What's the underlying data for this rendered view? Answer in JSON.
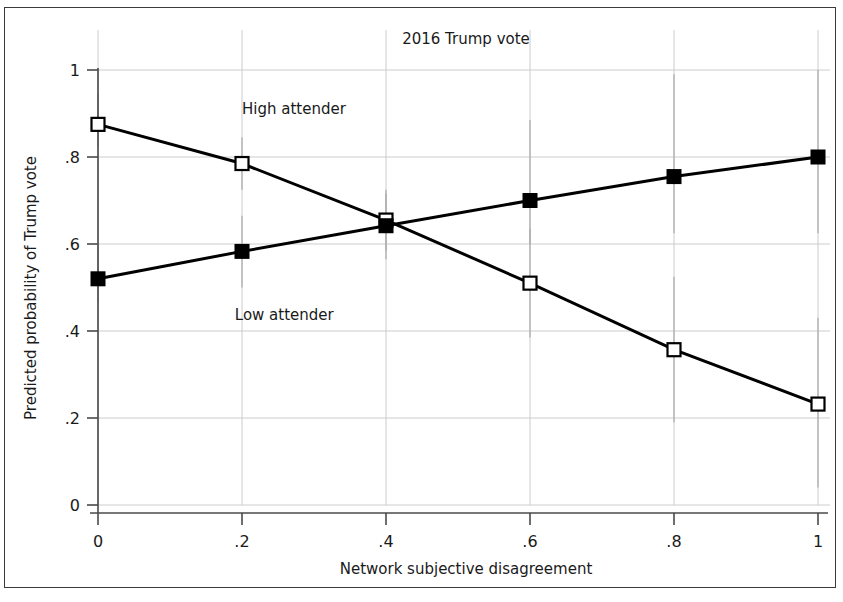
{
  "chart_data": {
    "type": "line",
    "title": "2016 Trump vote",
    "xlabel": "Network subjective disagreement",
    "ylabel": "Predicted probability of Trump vote",
    "x": [
      0,
      0.2,
      0.4,
      0.6,
      0.8,
      1
    ],
    "xticklabels": [
      "0",
      ".2",
      ".4",
      ".6",
      ".8",
      "1"
    ],
    "yticklabels": [
      "0",
      ".2",
      ".4",
      ".6",
      ".8",
      "1"
    ],
    "yticks": [
      0,
      0.2,
      0.4,
      0.6,
      0.8,
      1
    ],
    "xlim": [
      -0.04,
      1.04
    ],
    "ylim": [
      0,
      1.04
    ],
    "grid": "horizontal-and-vertical-light",
    "legend_position": "inline-annotations",
    "series": [
      {
        "name": "High attender",
        "marker": "open-square",
        "values": [
          0.875,
          0.785,
          0.655,
          0.51,
          0.357,
          0.232
        ],
        "errors_low": [
          0.825,
          0.725,
          0.585,
          0.385,
          0.19,
          0.04
        ],
        "errors_high": [
          0.945,
          0.845,
          0.725,
          0.635,
          0.525,
          0.43
        ],
        "label": "High attender",
        "label_x": 0.2,
        "label_y": 0.9
      },
      {
        "name": "Low attender",
        "marker": "filled-square",
        "values": [
          0.52,
          0.583,
          0.642,
          0.7,
          0.755,
          0.8
        ],
        "errors_low": [
          0.465,
          0.5,
          0.565,
          0.6,
          0.625,
          0.625
        ],
        "errors_high": [
          0.595,
          0.665,
          0.715,
          0.885,
          0.99,
          1.0
        ],
        "label": "Low attender",
        "label_x": 0.19,
        "label_y": 0.425
      }
    ],
    "colors": {
      "line": "#000000",
      "marker_fill_open": "#ffffff",
      "marker_fill_closed": "#000000",
      "grid": "#cccccc",
      "axis": "#4a4a4a",
      "error_bar": "#aaaaaa",
      "text": "#1a1a1a",
      "background": "#ffffff",
      "frame": "#3a3a3a"
    }
  }
}
